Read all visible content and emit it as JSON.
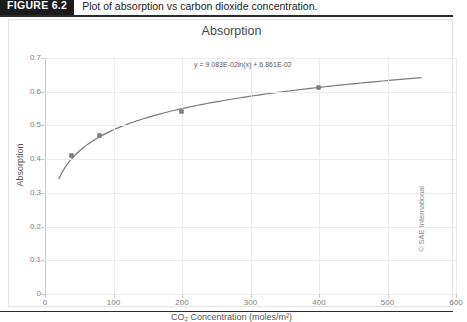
{
  "figure": {
    "tag": "FIGURE 6.2",
    "caption": "Plot of absorption vs carbon dioxide concentration.",
    "credit": "© SAE International"
  },
  "chart_data": {
    "type": "line",
    "title": "Absorption",
    "xlabel": "CO₂ Concentration (moles/m²)",
    "ylabel": "Absorption",
    "xlim": [
      0,
      600
    ],
    "ylim": [
      0,
      0.7
    ],
    "xticks": [
      "0",
      "100",
      "200",
      "300",
      "400",
      "500",
      "600"
    ],
    "yticks": [
      "0",
      "0.1",
      "0.2",
      "0.3",
      "0.4",
      "0.5",
      "0.6",
      "0.7"
    ],
    "grid": true,
    "legend": "none",
    "annotation": "y = 9.083E-02ln(x) + 6.861E-02",
    "fit": {
      "form": "logarithmic",
      "slope": 0.09083,
      "intercept": 0.06861
    },
    "series": [
      {
        "name": "Absorption",
        "x": [
          40,
          80,
          200,
          400
        ],
        "values": [
          0.41,
          0.47,
          0.54,
          0.61
        ]
      }
    ],
    "curve": {
      "x_start": 20,
      "x_end": 550,
      "y_start": 0.33,
      "y_end": 0.64
    }
  }
}
